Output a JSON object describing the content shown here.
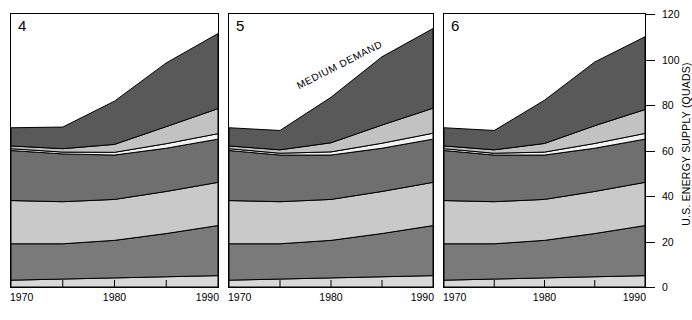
{
  "chart_data": {
    "type": "area",
    "title": "",
    "subtitle": "",
    "xlabel": "",
    "ylabel": "U.S. ENERGY SUPPLY (QUADS)",
    "xlim": [
      1970,
      1990
    ],
    "ylim": [
      0,
      120
    ],
    "yticks": [
      0,
      20,
      40,
      60,
      80,
      100,
      120
    ],
    "ytick_labels": [
      "0",
      "20",
      "40",
      "60",
      "80",
      "100",
      "120"
    ],
    "xticks": [
      1970,
      1975,
      1980,
      1985,
      1990
    ],
    "xtick_labels": [
      "1970",
      "",
      "1980",
      "",
      "1990"
    ],
    "xtick_labels_shown": [
      "1970",
      "1980",
      "1990"
    ],
    "grid": false,
    "legend_position": "none",
    "stacked": true,
    "annotations": [
      {
        "text": "MEDIUM DEMAND",
        "panel": "5",
        "x": 1984,
        "y": 92,
        "rotation": -27
      }
    ],
    "x": [
      1970,
      1975,
      1980,
      1985,
      1990
    ],
    "panels": [
      {
        "label": "4",
        "series": [
          {
            "name": "band-1-bottom",
            "fill": "#d8d8d8",
            "values": [
              3,
              3.5,
              4,
              4.5,
              5
            ]
          },
          {
            "name": "band-2",
            "fill": "#7a7a7a",
            "values": [
              16,
              15.5,
              16.5,
              19,
              22
            ]
          },
          {
            "name": "band-3",
            "fill": "#c9c9c9",
            "values": [
              19,
              18.5,
              18,
              18.5,
              19
            ]
          },
          {
            "name": "band-4",
            "fill": "#6f6f6f",
            "values": [
              22,
              21,
              19.5,
              19,
              19
            ]
          },
          {
            "name": "band-5-thin",
            "fill": "#f2f2f2",
            "values": [
              0.8,
              0.8,
              1.2,
              2.0,
              2.4
            ]
          },
          {
            "name": "band-6",
            "fill": "#c2c2c2",
            "values": [
              1.2,
              1.5,
              3.5,
              7.5,
              11
            ]
          },
          {
            "name": "band-7-top",
            "fill": "#595959",
            "values": [
              8,
              9.5,
              19,
              28,
              33
            ]
          }
        ],
        "totals": [
          70,
          69.8,
          81.7,
          98.5,
          111.4
        ]
      },
      {
        "label": "5",
        "series": [
          {
            "name": "band-1-bottom",
            "fill": "#d8d8d8",
            "values": [
              3,
              3.5,
              4,
              4.5,
              5
            ]
          },
          {
            "name": "band-2",
            "fill": "#7a7a7a",
            "values": [
              16,
              15.5,
              16.5,
              19,
              22
            ]
          },
          {
            "name": "band-3",
            "fill": "#c9c9c9",
            "values": [
              19,
              18.5,
              18,
              18.5,
              19
            ]
          },
          {
            "name": "band-4",
            "fill": "#6f6f6f",
            "values": [
              22,
              20.5,
              19.5,
              19,
              19
            ]
          },
          {
            "name": "band-5-thin",
            "fill": "#f2f2f2",
            "values": [
              0.8,
              0.8,
              1.4,
              2.2,
              2.6
            ]
          },
          {
            "name": "band-6",
            "fill": "#c2c2c2",
            "values": [
              1.2,
              1.5,
              4.0,
              8.0,
              11
            ]
          },
          {
            "name": "band-7-top",
            "fill": "#595959",
            "values": [
              8,
              8.5,
              20,
              30,
              35
            ]
          }
        ],
        "totals": [
          70,
          68.8,
          83.4,
          101.2,
          113.6
        ]
      },
      {
        "label": "6",
        "series": [
          {
            "name": "band-1-bottom",
            "fill": "#d8d8d8",
            "values": [
              3,
              3.5,
              4,
              4.5,
              5
            ]
          },
          {
            "name": "band-2",
            "fill": "#7a7a7a",
            "values": [
              16,
              15.5,
              16.5,
              19,
              22
            ]
          },
          {
            "name": "band-3",
            "fill": "#c9c9c9",
            "values": [
              19,
              18.5,
              18,
              18.5,
              19
            ]
          },
          {
            "name": "band-4",
            "fill": "#6f6f6f",
            "values": [
              22,
              20.5,
              19.5,
              19,
              19
            ]
          },
          {
            "name": "band-5-thin",
            "fill": "#f2f2f2",
            "values": [
              0.8,
              0.8,
              1.3,
              2.1,
              2.5
            ]
          },
          {
            "name": "band-6",
            "fill": "#c2c2c2",
            "values": [
              1.2,
              1.5,
              3.8,
              7.8,
              10.5
            ]
          },
          {
            "name": "band-7-top",
            "fill": "#595959",
            "values": [
              8,
              8.5,
              19,
              28,
              32
            ]
          }
        ],
        "totals": [
          70,
          68.8,
          82.1,
          98.9,
          110
        ]
      }
    ],
    "colors": {
      "top_band": "#595959",
      "upper_light": "#c2c2c2",
      "sliver": "#f2f2f2",
      "mid_dark": "#6f6f6f",
      "mid_light": "#c9c9c9",
      "lower_dark": "#7a7a7a",
      "base_light": "#d8d8d8",
      "outline": "#000000",
      "background": "#ffffff"
    }
  }
}
